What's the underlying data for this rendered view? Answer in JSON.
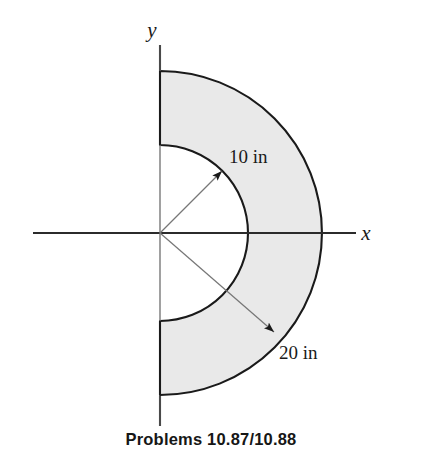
{
  "figure": {
    "title": "Problems 10.87/10.88",
    "shape_name": "half-annulus",
    "fill_color": "#e9e9e9",
    "outline_color": "#1a1a1a",
    "axis_color": "#2b2b2b",
    "dimension_line_color": "#6e6e6e",
    "origin": {
      "x": 160,
      "y": 233
    },
    "outer_radius_px": 162,
    "inner_radius_px": 88,
    "axes": {
      "x_label": "x",
      "y_label": "y",
      "x_axis_start_px": 33,
      "x_axis_end_px": 356,
      "y_axis_style": "dashed-stub"
    },
    "dimensions": [
      {
        "id": "inner-radius",
        "label": "10 in",
        "value": 10,
        "unit": "in",
        "angle_deg": 45,
        "label_x": 228,
        "label_y": 163,
        "arrow_tip_x": 222,
        "arrow_tip_y": 171
      },
      {
        "id": "outer-radius",
        "label": "20 in",
        "value": 20,
        "unit": "in",
        "angle_deg": -45,
        "label_x": 281,
        "label_y": 358,
        "arrow_tip_x": 274,
        "arrow_tip_y": 332
      }
    ]
  },
  "caption": {
    "text": "Problems 10.87/10.88"
  }
}
